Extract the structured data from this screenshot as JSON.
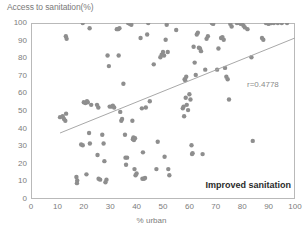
{
  "chart_data": {
    "type": "scatter",
    "title": "",
    "ylabel": "Access to sanitation(%)",
    "xlabel": "% urban",
    "xlim": [
      0,
      100
    ],
    "ylim": [
      0,
      100
    ],
    "grid": false,
    "legend_position": "none",
    "x_ticks": [
      0,
      10,
      20,
      30,
      40,
      50,
      60,
      70,
      80,
      90,
      100
    ],
    "y_ticks": [
      0,
      10,
      20,
      30,
      40,
      50,
      60,
      70,
      80,
      90,
      100
    ],
    "annotations": [
      {
        "name": "correlation",
        "text": "r=0.4778",
        "x": 83,
        "y": 63
      },
      {
        "name": "series-label",
        "text": "Improved sanitation",
        "x": 78,
        "y": 6
      }
    ],
    "point_color": "#8e8e8e",
    "line_color": "#a8a8a8",
    "axis_color": "#b9b9b9",
    "trend_line": {
      "x0": 11,
      "y0": 37.5,
      "x1": 100,
      "y1": 91.5
    },
    "series": [
      {
        "name": "Improved sanitation",
        "points": [
          [
            13.2,
            92.5
          ],
          [
            13.5,
            91.0
          ],
          [
            11.0,
            46.5
          ],
          [
            12.0,
            47.0
          ],
          [
            12.5,
            45.5
          ],
          [
            13.3,
            48.5
          ],
          [
            13.0,
            44.5
          ],
          [
            17.2,
            12.5
          ],
          [
            17.5,
            10.5
          ],
          [
            17.4,
            9.0
          ],
          [
            19.6,
            100.0
          ],
          [
            19.0,
            31.0
          ],
          [
            19.6,
            30.5
          ],
          [
            20.0,
            55.0
          ],
          [
            20.6,
            54.5
          ],
          [
            21.2,
            55.5
          ],
          [
            21.5,
            55.0
          ],
          [
            21.0,
            14.0
          ],
          [
            22.2,
            97.0
          ],
          [
            22.0,
            37.5
          ],
          [
            22.3,
            31.5
          ],
          [
            22.8,
            53.5
          ],
          [
            25.0,
            53.5
          ],
          [
            25.5,
            52.0
          ],
          [
            25.2,
            25.0
          ],
          [
            25.6,
            11.5
          ],
          [
            26.2,
            11.0
          ],
          [
            27.0,
            36.5
          ],
          [
            27.5,
            31.5
          ],
          [
            27.8,
            21.5
          ],
          [
            28.2,
            9.5
          ],
          [
            28.6,
            11.0
          ],
          [
            29.0,
            81.5
          ],
          [
            29.5,
            75.5
          ],
          [
            29.8,
            52.5
          ],
          [
            30.5,
            52.5
          ],
          [
            31.0,
            53.0
          ],
          [
            31.5,
            52.0
          ],
          [
            32.5,
            96.5
          ],
          [
            33.0,
            96.5
          ],
          [
            33.5,
            97.0
          ],
          [
            33.2,
            81.5
          ],
          [
            33.8,
            49.5
          ],
          [
            34.2,
            44.5
          ],
          [
            34.5,
            45.5
          ],
          [
            35.0,
            65.5
          ],
          [
            35.6,
            36.5
          ],
          [
            35.8,
            23.5
          ],
          [
            36.0,
            19.5
          ],
          [
            36.4,
            23.5
          ],
          [
            36.8,
            100.0
          ],
          [
            37.5,
            99.5
          ],
          [
            38.0,
            99.0
          ],
          [
            38.4,
            44.5
          ],
          [
            38.6,
            34.0
          ],
          [
            38.8,
            35.0
          ],
          [
            39.0,
            33.5
          ],
          [
            39.4,
            34.5
          ],
          [
            39.2,
            17.0
          ],
          [
            39.6,
            13.5
          ],
          [
            40.0,
            14.5
          ],
          [
            41.5,
            91.5
          ],
          [
            42.0,
            51.5
          ],
          [
            42.4,
            26.5
          ],
          [
            42.2,
            11.5
          ],
          [
            42.8,
            11.5
          ],
          [
            43.2,
            12.0
          ],
          [
            43.5,
            52.0
          ],
          [
            44.0,
            93.5
          ],
          [
            44.4,
            100.0
          ],
          [
            45.0,
            55.5
          ],
          [
            46.5,
            76.5
          ],
          [
            47.5,
            17.0
          ],
          [
            48.0,
            32.5
          ],
          [
            49.0,
            80.5
          ],
          [
            49.5,
            82.0
          ],
          [
            50.0,
            83.5
          ],
          [
            50.4,
            81.5
          ],
          [
            50.6,
            24.0
          ],
          [
            51.0,
            90.5
          ],
          [
            51.4,
            99.0
          ],
          [
            51.8,
            83.5
          ],
          [
            52.0,
            17.0
          ],
          [
            52.4,
            13.5
          ],
          [
            55.0,
            96.0
          ],
          [
            57.5,
            51.5
          ],
          [
            57.8,
            52.5
          ],
          [
            58.2,
            68.0
          ],
          [
            58.4,
            67.5
          ],
          [
            58.8,
            69.5
          ],
          [
            58.0,
            47.0
          ],
          [
            58.6,
            57.5
          ],
          [
            59.0,
            53.5
          ],
          [
            59.5,
            50.5
          ],
          [
            60.0,
            59.5
          ],
          [
            60.4,
            56.5
          ],
          [
            60.8,
            30.5
          ],
          [
            61.2,
            26.0
          ],
          [
            61.0,
            25.5
          ],
          [
            61.6,
            86.5
          ],
          [
            62.0,
            77.5
          ],
          [
            62.4,
            70.5
          ],
          [
            62.8,
            93.5
          ],
          [
            63.2,
            94.5
          ],
          [
            63.6,
            86.0
          ],
          [
            64.0,
            85.5
          ],
          [
            64.4,
            84.0
          ],
          [
            65.0,
            25.5
          ],
          [
            66.0,
            73.5
          ],
          [
            66.5,
            91.0
          ],
          [
            67.0,
            92.5
          ],
          [
            68.5,
            100.0
          ],
          [
            69.0,
            99.5
          ],
          [
            70.5,
            73.5
          ],
          [
            71.0,
            85.5
          ],
          [
            72.0,
            91.5
          ],
          [
            72.5,
            92.0
          ],
          [
            73.0,
            90.5
          ],
          [
            73.5,
            74.5
          ],
          [
            74.0,
            69.5
          ],
          [
            74.5,
            68.0
          ],
          [
            75.0,
            56.5
          ],
          [
            75.5,
            99.5
          ],
          [
            76.0,
            98.0
          ],
          [
            78.0,
            100.0
          ],
          [
            79.0,
            100.0
          ],
          [
            79.5,
            99.5
          ],
          [
            80.0,
            100.0
          ],
          [
            80.5,
            98.5
          ],
          [
            81.0,
            97.5
          ],
          [
            82.0,
            96.5
          ],
          [
            83.5,
            80.5
          ],
          [
            84.0,
            33.0
          ],
          [
            87.5,
            91.5
          ],
          [
            88.0,
            90.5
          ],
          [
            89.0,
            100.0
          ],
          [
            90.0,
            99.5
          ],
          [
            91.0,
            100.0
          ],
          [
            92.0,
            100.0
          ],
          [
            93.5,
            100.0
          ],
          [
            95.0,
            100.0
          ],
          [
            97.0,
            100.0
          ]
        ]
      }
    ]
  }
}
